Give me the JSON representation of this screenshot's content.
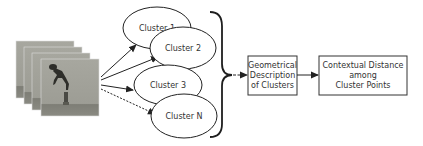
{
  "diagram": {
    "input": {
      "name": "video-frames-stack",
      "frames": 4
    },
    "clusters": [
      {
        "label": "Cluster 1",
        "edge": "solid"
      },
      {
        "label": "Cluster 2",
        "edge": "solid"
      },
      {
        "label": "Cluster 3",
        "edge": "solid"
      },
      {
        "label": "Cluster N",
        "edge": "dashed"
      }
    ],
    "steps": [
      {
        "lines": [
          "Geometrical",
          "Description",
          "of Clusters"
        ]
      },
      {
        "lines": [
          "Contextual Distance",
          "among",
          "Cluster Points"
        ]
      }
    ],
    "colors": {
      "stroke": "#222222",
      "text": "#333333",
      "frame": "#9a9a92",
      "ground": "#7d7d75"
    }
  }
}
